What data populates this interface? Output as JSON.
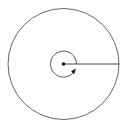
{
  "diagram": {
    "type": "circle-radius-angle",
    "outer_circle": {
      "cx": 63.5,
      "cy": 64,
      "r": 55.5,
      "stroke": "#555555"
    },
    "center_point": {
      "cx": 63.5,
      "cy": 64,
      "r": 1.8,
      "fill": "#111111"
    },
    "radius_line": {
      "x1": 63.5,
      "y1": 64,
      "x2": 119,
      "y2": 64,
      "stroke": "#333333"
    },
    "rotation_arc": {
      "cx": 63.5,
      "cy": 64,
      "r": 13,
      "stroke": "#444444",
      "direction": "counterclockwise"
    },
    "arrowhead": {
      "x": 74.5,
      "y": 71,
      "fill": "#111111"
    }
  }
}
